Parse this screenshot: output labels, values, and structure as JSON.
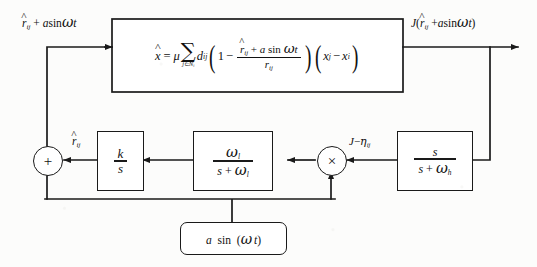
{
  "figure": {
    "type": "control-system-block-diagram",
    "background_color": "#fcfcfb",
    "line_color": "#1a1a1a"
  },
  "main_block": {
    "name": "plant-dynamics",
    "equation_plain": "xdot = mu * sum_{j in N_i} d_ij ( 1 - ( rhat_ij + a sin(omega t) ) / r_ij ) ( x_j - x_i )",
    "lhs": "x",
    "equals": "=",
    "mu": "μ",
    "sum_symbol": "∑",
    "sum_subscript": "j∈N",
    "sum_subscript_index": "i",
    "coefficient": "d",
    "coefficient_sub": "ij",
    "one": "1",
    "minus": "−",
    "frac_num_r": "r",
    "frac_num_r_sub": "ij",
    "frac_num_plus": "+",
    "frac_num_amp": "a",
    "frac_num_sin": "sin",
    "frac_num_omega": "ω",
    "frac_num_t": "t",
    "frac_den_r": "r",
    "frac_den_sub": "ij",
    "x_j": "x",
    "x_j_sub": "j",
    "x_i": "x",
    "x_i_sub": "i"
  },
  "labels": {
    "input": {
      "r": "r",
      "r_sub": "ij",
      "plus": "+",
      "amp": "a",
      "sin": "sin",
      "omega": "ω",
      "t": "t"
    },
    "output": {
      "J": "J",
      "open": "(",
      "r": "r",
      "r_sub": "ij",
      "plus": "+",
      "amp": "a",
      "sin": "sin",
      "omega": "ω",
      "t": "t",
      "close": ")"
    },
    "demod_input": {
      "J": "J",
      "minus": "−",
      "eta": "η",
      "eta_sub": "ij"
    },
    "lowpass_output": {
      "xi": "ξ",
      "xi_sub": "ij"
    },
    "integrator_output": {
      "r": "r",
      "r_sub": "ij"
    }
  },
  "blocks": {
    "highpass": {
      "name": "highpass-filter",
      "num": "s",
      "den_s": "s",
      "den_plus": "+",
      "den_omega": "ω",
      "den_sub": "h"
    },
    "lowpass": {
      "name": "lowpass-filter",
      "num_omega": "ω",
      "num_sub": "l",
      "den_s": "s",
      "den_plus": "+",
      "den_omega": "ω",
      "den_sub": "l"
    },
    "integrator": {
      "name": "integrator-gain",
      "num": "k",
      "den": "s"
    }
  },
  "nodes": {
    "sum_junction": {
      "name": "summing-junction",
      "symbol": "+"
    },
    "multiplier": {
      "name": "multiplier-node",
      "symbol": "×"
    }
  },
  "source": {
    "name": "dither-oscillator",
    "amp": "a",
    "sin": "sin",
    "open": "(",
    "omega": "ω",
    "t": "t",
    "close": ")"
  }
}
